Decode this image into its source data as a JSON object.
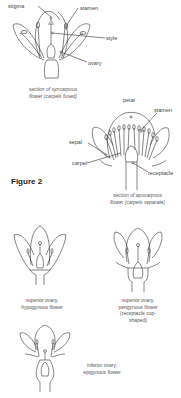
{
  "figure_label": "Figure 2",
  "syncarpous": {
    "labels": {
      "stigma": "stigma",
      "stamen": "stamen",
      "style": "style",
      "ovary": "ovary"
    },
    "caption_line1": "section of syncarpous",
    "caption_line2": "flower (carpels fused)"
  },
  "apocarpous": {
    "labels": {
      "petal": "petal",
      "stamen": "stamen",
      "sepal": "sepal",
      "carpel": "carpel",
      "receptacle": "receptacle"
    },
    "caption_line1": "section of apocarpous",
    "caption_line2": "flower (carpels separate)"
  },
  "hypogynous": {
    "caption_line1": "superior ovary,",
    "caption_line2": "hypogynous flower"
  },
  "perigynous": {
    "caption_line1": "superior ovary,",
    "caption_line2": "perigynous flower",
    "caption_line3": "(receptacle cup-",
    "caption_line4": "shaped)"
  },
  "epigynous": {
    "caption_line1": "inferior ovary,",
    "caption_line2": "epigynous flower"
  }
}
